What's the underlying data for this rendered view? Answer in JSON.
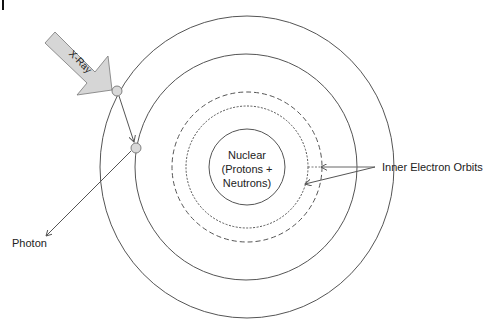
{
  "diagram": {
    "labels": {
      "xray": "X-Ray",
      "nucleus_line1": "Nuclear",
      "nucleus_line2": "(Protons +",
      "nucleus_line3": "Neutrons)",
      "inner_orbits": "Inner Electron Orbits",
      "photon": "Photon"
    },
    "colors": {
      "stroke": "#555555",
      "arrow_fill": "#d6d6d6",
      "electron_fill": "#d9d9d9",
      "text": "#222222"
    },
    "orbits": [
      {
        "name": "outer-orbit",
        "style": "solid",
        "radius": 148
      },
      {
        "name": "second-orbit",
        "style": "solid",
        "radius": 112
      },
      {
        "name": "inner-orbit-dashed",
        "style": "dashed",
        "radius": 74
      },
      {
        "name": "inner-orbit-dotted",
        "style": "dotted",
        "radius": 61
      },
      {
        "name": "nucleus",
        "style": "solid",
        "radius": 38
      }
    ]
  }
}
